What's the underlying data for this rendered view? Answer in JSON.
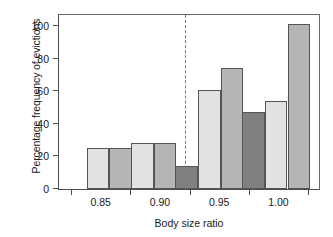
{
  "chart_data": {
    "type": "bar",
    "title": "",
    "xlabel": "Body size ratio",
    "ylabel": "Percentage frequency of evictions",
    "categories": [
      "0.85",
      "0.90",
      "0.95",
      "1.00"
    ],
    "ylim": [
      0,
      108
    ],
    "yticks": [
      0,
      20,
      40,
      60,
      80,
      100
    ],
    "ytick_labels": [
      "0",
      "20",
      "40",
      "60",
      "80",
      "100"
    ],
    "xtick_labels": [
      "0.85",
      "0.90",
      "0.95",
      "1.00"
    ],
    "grid": false,
    "legend": "none",
    "series": [
      {
        "name": "dark-gray-series",
        "color": "#808080",
        "values": [
          null,
          null,
          14,
          47.5
        ]
      },
      {
        "name": "light-gray-series",
        "color": "#e2e2e2",
        "values": [
          25,
          28.5,
          60.5,
          54
        ]
      },
      {
        "name": "medium-gray-series",
        "color": "#b5b5b5",
        "values": [
          25,
          28.5,
          74,
          101
        ]
      }
    ],
    "annotations": [
      {
        "name": "vertical-dashed-divider",
        "type": "vline",
        "between": [
          "0.90",
          "0.95"
        ],
        "style": "dashed",
        "color": "#7a7a7a"
      }
    ],
    "bars": [
      {
        "group": "0.85",
        "series": "light-gray-series",
        "value": 25,
        "color": "#e2e2e2",
        "x": 14.0,
        "width": 11.5
      },
      {
        "group": "0.85",
        "series": "medium-gray-series",
        "value": 25,
        "color": "#b5b5b5",
        "x": 25.5,
        "width": 11.5
      },
      {
        "group": "0.90",
        "series": "light-gray-series",
        "value": 28.5,
        "color": "#e2e2e2",
        "x": 36.5,
        "width": 11.5
      },
      {
        "group": "0.90",
        "series": "medium-gray-series",
        "value": 28.5,
        "color": "#b5b5b5",
        "x": 48.0,
        "width": 11.5
      },
      {
        "group": "0.95",
        "series": "dark-gray-series",
        "value": 14,
        "color": "#808080",
        "x": 59.0,
        "width": 11.5
      },
      {
        "group": "0.95",
        "series": "light-gray-series",
        "value": 60.5,
        "color": "#e2e2e2",
        "x": 70.5,
        "width": 11.5
      },
      {
        "group": "0.95",
        "series": "medium-gray-series",
        "value": 74,
        "color": "#b5b5b5",
        "x": 82.0,
        "width": 11.5
      },
      {
        "group": "1.00",
        "series": "dark-gray-series",
        "value": 47.5,
        "color": "#808080",
        "x": 93.0,
        "width": 11.5
      },
      {
        "group": "1.00",
        "series": "light-gray-series",
        "value": 54,
        "color": "#e2e2e2",
        "x": 104.5,
        "width": 11.5
      },
      {
        "group": "1.00",
        "series": "medium-gray-series",
        "value": 101,
        "color": "#b5b5b5",
        "x": 116.0,
        "width": 11.5
      }
    ],
    "divider_x_pct": 48.5,
    "xtick_positions_pct": [
      16.0,
      38.8,
      61.6,
      84.4
    ],
    "xtick_minor_positions_pct": [
      4.6,
      27.4,
      50.2,
      73.0,
      95.8
    ]
  }
}
